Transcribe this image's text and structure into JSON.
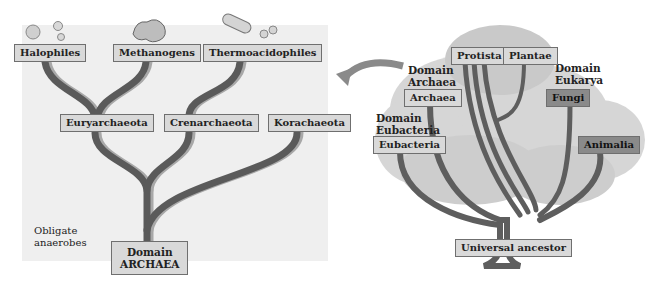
{
  "left_panel": {
    "title": "Domain Archaea phylogeny",
    "leaves": [
      "Halophiles",
      "Methanogens",
      "Thermoacidophiles"
    ],
    "phyla": [
      "Euryarchaeota",
      "Crenarchaeota",
      "Korachaeota"
    ],
    "root": {
      "line1": "Domain",
      "line2": "ARCHAEA"
    },
    "note": {
      "line1": "Obligate",
      "line2": "anaerobes"
    }
  },
  "right_panel": {
    "title": "Tree of life",
    "domain_labels": {
      "archaea": {
        "line1": "Domain",
        "line2": "Archaea"
      },
      "eubacteria": {
        "line1": "Domain",
        "line2": "Eubacteria"
      },
      "eukarya": {
        "line1": "Domain",
        "line2": "Eukarya"
      }
    },
    "nodes": {
      "protista": "Protista",
      "plantae": "Plantae",
      "archaea": "Archaea",
      "fungi": "Fungi",
      "eubacteria": "Eubacteria",
      "animalia": "Animalia",
      "root": "Universal ancestor"
    }
  },
  "colors": {
    "panel_bg": "#efefef",
    "branch_dark": "#5a5a5a",
    "branch_light": "#a8a8a8",
    "label_bg": "#d9d9d9",
    "label_dark_bg": "#8a8a8a",
    "foliage": "#cfcfcf"
  }
}
